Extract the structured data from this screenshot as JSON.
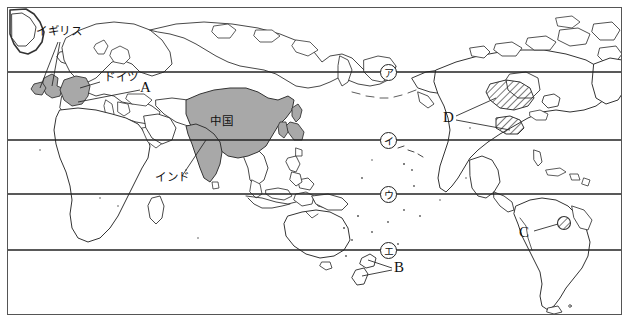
{
  "figure": {
    "type": "world-map-worksheet",
    "title": "",
    "projection": "rectangular world map centered on the Pacific",
    "background_color": "#ffffff",
    "frame_color": "#555555",
    "coastline_color": "#333333",
    "shade_color": "#a8a8a8",
    "hatch_color": "#333333"
  },
  "country_labels": [
    {
      "id": "uk",
      "text": "イギリス",
      "x": 36,
      "y": 32,
      "leader_count": 2
    },
    {
      "id": "germany",
      "text": "ドイツ",
      "x": 104,
      "y": 78,
      "leader_count": 1
    },
    {
      "id": "china",
      "text": "中国",
      "x": 210,
      "y": 122,
      "leader_count": 0
    },
    {
      "id": "india",
      "text": "インド",
      "x": 155,
      "y": 180,
      "leader_count": 1
    }
  ],
  "answer_labels": [
    {
      "id": "A",
      "text": "A",
      "x": 144,
      "y": 86,
      "leader_count": 1,
      "target": "germany"
    },
    {
      "id": "B",
      "text": "B",
      "x": 396,
      "y": 268,
      "leader_count": 2,
      "target": "new-zealand"
    },
    {
      "id": "C",
      "text": "C",
      "x": 521,
      "y": 234,
      "leader_count": 1,
      "target": "chile-coast"
    },
    {
      "id": "D",
      "text": "D",
      "x": 445,
      "y": 118,
      "leader_count": 2,
      "target": "north-america-hatched"
    }
  ],
  "latitude_markers": [
    {
      "id": "ア",
      "text": "ア",
      "x": 388,
      "y": 72,
      "line_y": 72
    },
    {
      "id": "イ",
      "text": "イ",
      "x": 388,
      "y": 140,
      "line_y": 140
    },
    {
      "id": "ウ",
      "text": "ウ",
      "x": 388,
      "y": 194,
      "line_y": 194
    },
    {
      "id": "エ",
      "text": "エ",
      "x": 388,
      "y": 250,
      "line_y": 250
    }
  ],
  "latitude_lines": [
    72,
    140,
    194,
    250
  ],
  "shaded_regions": [
    {
      "name": "united-kingdom",
      "fill": "solid-gray"
    },
    {
      "name": "germany",
      "fill": "solid-gray"
    },
    {
      "name": "china",
      "fill": "solid-gray"
    },
    {
      "name": "india",
      "fill": "solid-gray"
    },
    {
      "name": "japan",
      "fill": "solid-gray"
    }
  ],
  "hatched_regions": [
    {
      "name": "north-america-upper",
      "fill": "diagonal-hatch"
    },
    {
      "name": "north-america-lower",
      "fill": "diagonal-hatch"
    },
    {
      "name": "chile-coast-circle",
      "fill": "diagonal-hatch"
    }
  ]
}
